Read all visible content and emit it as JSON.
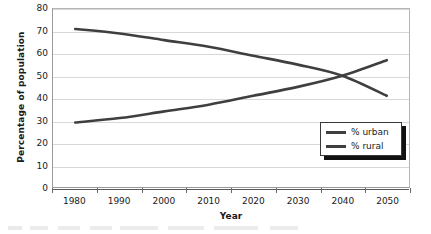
{
  "chart_data": {
    "type": "line",
    "title": "",
    "xlabel": "Year",
    "ylabel": "Percentage of population",
    "categories": [
      "1980",
      "1990",
      "2000",
      "2010",
      "2020",
      "2030",
      "2040",
      "2050"
    ],
    "x": [
      1980,
      1990,
      2000,
      2010,
      2020,
      2030,
      2040,
      2050
    ],
    "series": [
      {
        "name": "% urban",
        "color": "#3f3f3f",
        "values": [
          29,
          31,
          34,
          37,
          41,
          45,
          50,
          57
        ]
      },
      {
        "name": "% rural",
        "color": "#3f3f3f",
        "values": [
          71,
          69,
          66,
          63,
          59,
          55,
          50,
          41
        ]
      }
    ],
    "ylim": [
      0,
      80
    ],
    "y_ticks": [
      "0",
      "10",
      "20",
      "30",
      "40",
      "50",
      "60",
      "70",
      "80"
    ],
    "y_tick_values": [
      0,
      10,
      20,
      30,
      40,
      50,
      60,
      70,
      80
    ],
    "grid": "horizontal",
    "legend_position": "bottom-right",
    "legend_entries": [
      "% urban",
      "% rural"
    ],
    "annotations": [
      "Urban and rural percentage lines cross near 2040 at about 50%"
    ]
  },
  "axes": {
    "y_title": "Percentage of population",
    "x_title": "Year"
  },
  "legend": {
    "items": [
      {
        "label": "% urban"
      },
      {
        "label": "% rural"
      }
    ]
  },
  "colors": {
    "series_line": "#3f3f3f",
    "gridline": "#d8d8d8",
    "frame": "#9a9a9a",
    "legend_shadow": "#111111",
    "background": "#ffffff"
  }
}
